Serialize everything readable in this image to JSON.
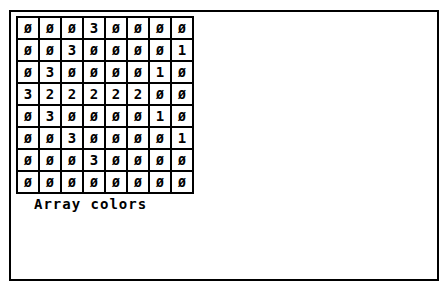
{
  "array": {
    "rows": [
      [
        "0",
        "0",
        "0",
        "3",
        "0",
        "0",
        "0",
        "0"
      ],
      [
        "0",
        "0",
        "3",
        "0",
        "0",
        "0",
        "0",
        "1"
      ],
      [
        "0",
        "3",
        "0",
        "0",
        "0",
        "0",
        "1",
        "0"
      ],
      [
        "3",
        "2",
        "2",
        "2",
        "2",
        "2",
        "0",
        "0"
      ],
      [
        "0",
        "3",
        "0",
        "0",
        "0",
        "0",
        "1",
        "0"
      ],
      [
        "0",
        "0",
        "3",
        "0",
        "0",
        "0",
        "0",
        "1"
      ],
      [
        "0",
        "0",
        "0",
        "3",
        "0",
        "0",
        "0",
        "0"
      ],
      [
        "0",
        "0",
        "0",
        "0",
        "0",
        "0",
        "0",
        "0"
      ]
    ],
    "zero_glyph": "Ø"
  },
  "caption": "Array colors"
}
